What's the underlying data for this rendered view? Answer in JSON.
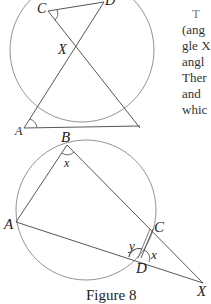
{
  "figure_top": {
    "labels": {
      "C": "C",
      "D": "D",
      "X": "X",
      "A": "A"
    }
  },
  "figure_bottom": {
    "labels": {
      "B": "B",
      "A": "A",
      "C": "C",
      "D": "D",
      "X": "X",
      "x_at_B": "x",
      "x_at_D": "x",
      "y_at_D": "y"
    },
    "caption": "Figure 8"
  },
  "body_text": {
    "lines": [
      "T",
      "(ang",
      "gle X",
      "angl",
      "Ther",
      "and",
      "whic"
    ]
  }
}
